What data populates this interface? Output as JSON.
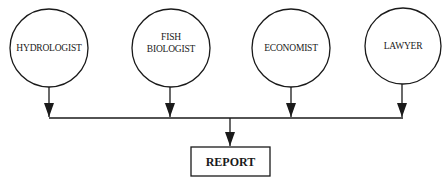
{
  "diagram": {
    "type": "flow",
    "nodes": [
      {
        "id": "hydrologist",
        "lines": [
          "HYDROLOGIST"
        ]
      },
      {
        "id": "fish-biologist",
        "lines": [
          "FISH",
          "BIOLOGIST"
        ]
      },
      {
        "id": "economist",
        "lines": [
          "ECONOMIST"
        ]
      },
      {
        "id": "lawyer",
        "lines": [
          "LAWYER"
        ]
      }
    ],
    "output": {
      "id": "report",
      "label": "REPORT"
    },
    "edges": [
      {
        "from": "hydrologist",
        "to": "report"
      },
      {
        "from": "fish-biologist",
        "to": "report"
      },
      {
        "from": "economist",
        "to": "report"
      },
      {
        "from": "lawyer",
        "to": "report"
      }
    ],
    "colors": {
      "line": "#1a1a1a",
      "background": "#ffffff"
    }
  }
}
